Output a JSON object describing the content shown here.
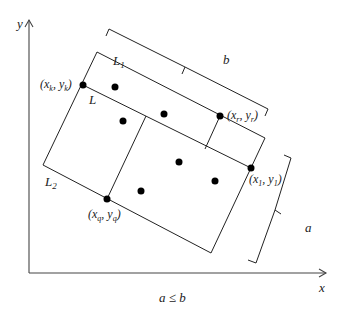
{
  "axes": {
    "x_label": "x",
    "y_label": "y"
  },
  "labels": {
    "L1": "L",
    "L1_sub": "1",
    "L2": "L",
    "L2_sub": "2",
    "L": "L",
    "b": "b",
    "a": "a",
    "caption": "a ≤ b"
  },
  "points": {
    "k": {
      "x": "x",
      "xs": "k",
      "y": "y",
      "ys": "k",
      "label": "(x_k, y_k)"
    },
    "r": {
      "x": "x",
      "xs": "r",
      "y": "y",
      "ys": "r",
      "label": "(x_r, y_r)"
    },
    "one": {
      "x": "x",
      "xs": "1",
      "y": "y",
      "ys": "1",
      "label": "(x_1, y_1)"
    },
    "q": {
      "x": "x",
      "xs": "q",
      "y": "y",
      "ys": "q",
      "label": "(x_q, y_q)"
    }
  },
  "interior_points_count": 5,
  "colors": {
    "ink": "#222222",
    "background": "#ffffff"
  }
}
